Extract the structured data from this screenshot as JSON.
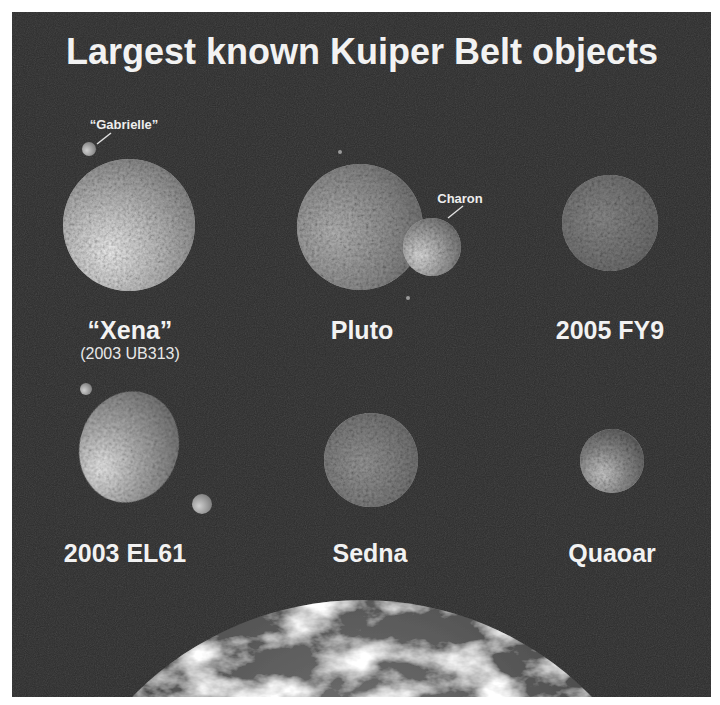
{
  "title": "Largest known Kuiper Belt objects",
  "colors": {
    "background": "#2b2b2b",
    "border": "#ffffff",
    "label": "#f2f2f2"
  },
  "objects": [
    {
      "name": "“Xena”",
      "subtitle": "(2003 UB313)",
      "moons": [
        {
          "name": "“Gabrielle”"
        }
      ]
    },
    {
      "name": "Pluto",
      "moons": [
        {
          "name": "Charon"
        }
      ]
    },
    {
      "name": "2005 FY9"
    },
    {
      "name": "2003 EL61"
    },
    {
      "name": "Sedna"
    },
    {
      "name": "Quaoar"
    }
  ],
  "earth": {
    "label": "Earth (partial, for scale)"
  }
}
